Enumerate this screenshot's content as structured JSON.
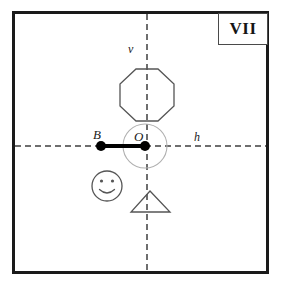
{
  "figure": {
    "plate_label": "VII",
    "background_color": "#ffffff",
    "frame_color": "#1a1a1a",
    "axis_color": "#6e6e6e",
    "shape_stroke_color": "#555555",
    "marker_color": "#000000",
    "circle_color": "#9a9a9a"
  },
  "axes": {
    "vertical": {
      "label": "v",
      "x": 147,
      "color": "#6e6e6e",
      "style": "dashed"
    },
    "horizontal": {
      "label": "h",
      "y": 146,
      "color": "#6e6e6e",
      "style": "dashed"
    }
  },
  "points": {
    "origin": {
      "label": "O",
      "x": 145,
      "y": 146
    },
    "b": {
      "label": "B",
      "x": 101,
      "y": 146
    }
  },
  "segment": {
    "from": "B",
    "to": "O",
    "color": "#000000",
    "width": 4
  },
  "shapes": [
    {
      "name": "octagon",
      "cx": 147,
      "cy": 95,
      "radius": 27
    },
    {
      "name": "rotation-circle",
      "cx": 145,
      "cy": 146,
      "radius": 22
    },
    {
      "name": "smiley-face",
      "cx": 107,
      "cy": 186,
      "radius": 15
    },
    {
      "name": "triangle",
      "cx": 150,
      "cy": 202,
      "width": 38,
      "height": 21
    }
  ]
}
